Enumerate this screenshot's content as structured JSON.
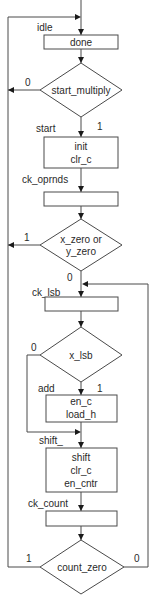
{
  "flowchart": {
    "states": {
      "idle": "idle",
      "start": "start",
      "ck_oprnds": "ck_oprnds",
      "ck_lsb": "ck_lsb",
      "add": "add",
      "shift": "shift_",
      "ck_count": "ck_count"
    },
    "boxes": {
      "done": [
        "done"
      ],
      "init": [
        "init",
        "clr_c"
      ],
      "ck_oprnds": [],
      "ck_lsb": [],
      "add": [
        "en_c",
        "load_h"
      ],
      "shift": [
        "shift",
        "clr_c",
        "en_cntr"
      ],
      "ck_count": []
    },
    "decisions": {
      "start_multiply": {
        "line1": "start_multiply",
        "true_label": "1",
        "false_label": "0"
      },
      "zero_check": {
        "line1": "x_zero or",
        "line2": "y_zero",
        "true_label": "1",
        "false_label": "0"
      },
      "x_lsb": {
        "line1": "x_lsb",
        "true_label": "1",
        "false_label": "0"
      },
      "count_zero": {
        "line1": "count_zero",
        "true_label": "1",
        "false_label": "0"
      }
    }
  }
}
